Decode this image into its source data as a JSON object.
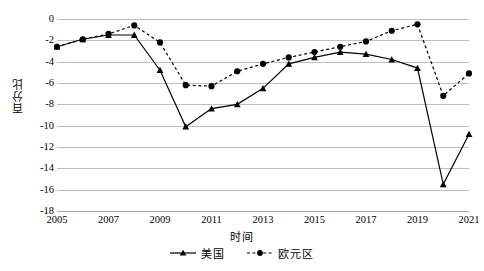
{
  "chart_data": {
    "type": "line",
    "title": "",
    "xlabel": "时间",
    "ylabel": "百分比",
    "x": [
      2005,
      2006,
      2007,
      2008,
      2009,
      2010,
      2011,
      2012,
      2013,
      2014,
      2015,
      2016,
      2017,
      2018,
      2019,
      2020,
      2021
    ],
    "xlim": [
      2005,
      2021
    ],
    "ylim": [
      -18,
      0
    ],
    "ytick_labels": [
      "0",
      "-2",
      "-4",
      "-6",
      "-8",
      "-10",
      "-12",
      "-14",
      "-16",
      "-18"
    ],
    "ytick_values": [
      0,
      -2,
      -4,
      -6,
      -8,
      -10,
      -12,
      -14,
      -16,
      -18
    ],
    "xtick_labels": [
      "2005",
      "2007",
      "2009",
      "2011",
      "2013",
      "2015",
      "2017",
      "2019",
      "2021"
    ],
    "xtick_values": [
      2005,
      2007,
      2009,
      2011,
      2013,
      2015,
      2017,
      2019,
      2021
    ],
    "grid": true,
    "legend_position": "bottom",
    "series": [
      {
        "name": "美国",
        "style": "solid",
        "marker": "triangle",
        "color": "#000000",
        "values": [
          -2.6,
          -1.9,
          -1.5,
          -1.5,
          -4.8,
          -10.1,
          -8.4,
          -8.0,
          -6.5,
          -4.2,
          -3.6,
          -3.1,
          -3.3,
          -3.8,
          -4.6,
          -15.5,
          -10.8
        ]
      },
      {
        "name": "欧元区",
        "style": "dashed",
        "marker": "circle",
        "color": "#000000",
        "values": [
          -2.6,
          -1.9,
          -1.4,
          -0.6,
          -2.2,
          -6.2,
          -6.3,
          -4.9,
          -4.2,
          -3.6,
          -3.1,
          -2.6,
          -2.1,
          -1.1,
          -0.5,
          -7.2,
          -5.1
        ]
      }
    ]
  },
  "axis": {
    "y_title": "百分比",
    "x_title": "时间"
  },
  "legend": {
    "items": [
      {
        "label": "美国",
        "marker": "triangle-marker-icon",
        "line": "solid-line-icon"
      },
      {
        "label": "欧元区",
        "marker": "circle-marker-icon",
        "line": "dashed-line-icon"
      }
    ]
  }
}
